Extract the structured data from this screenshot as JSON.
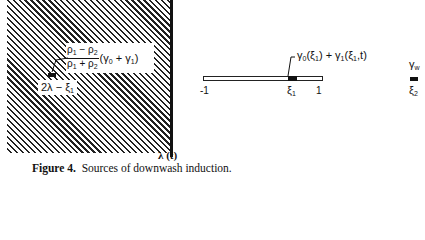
{
  "diagram": {
    "image_region": {
      "fill": "hatched",
      "reflected_label": {
        "numerator": "ρ₁ − ρ₂",
        "numerator_parts": [
          "ρ",
          "1",
          " − ρ",
          "2"
        ],
        "denominator_parts": [
          "ρ",
          "1",
          " + ρ",
          "2"
        ],
        "factor_parts": [
          "(γ",
          "0",
          " + γ",
          "1",
          ")"
        ]
      },
      "image_point_label_parts": [
        "2λ − ξ",
        "1"
      ]
    },
    "wall": {
      "label": "λ (t)"
    },
    "plate": {
      "left_label": "-1",
      "right_label": "1",
      "point_label_parts": [
        "ξ",
        "1"
      ],
      "vortex_label_parts": [
        "γ",
        "0",
        "(ξ",
        "1",
        ") + γ",
        "1",
        "(ξ",
        "1",
        ",t)"
      ]
    },
    "wake": {
      "vortex_label_parts": [
        "γ",
        "w"
      ],
      "point_label_parts": [
        "ξ",
        "2"
      ]
    },
    "colors": {
      "ink": "#111111",
      "background": "#ffffff"
    }
  },
  "caption": {
    "figure_label": "Figure 4.",
    "text": "Sources of downwash induction."
  }
}
